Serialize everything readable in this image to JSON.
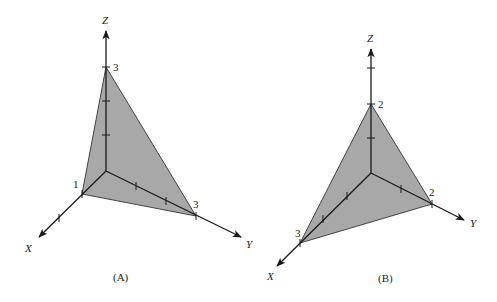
{
  "colors": {
    "plane_fill": "#a8a8a8",
    "line": "#1a1a1a",
    "background": "#ffffff"
  },
  "diagrams": [
    {
      "caption": "(A)",
      "axes": {
        "x": "X",
        "y": "Y",
        "z": "Z"
      },
      "intercepts": {
        "x": "1",
        "y": "3",
        "z": "3"
      }
    },
    {
      "caption": "(B)",
      "axes": {
        "x": "X",
        "y": "Y",
        "z": "Z"
      },
      "intercepts": {
        "x": "3",
        "y": "2",
        "z": "2"
      }
    }
  ]
}
